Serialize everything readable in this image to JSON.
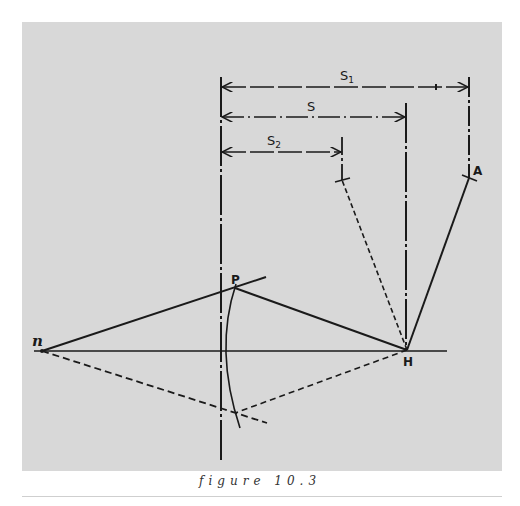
{
  "figure": {
    "caption": "figure 10.3",
    "background": "#d8d8d8",
    "ink": "#1a1a1a",
    "labels": {
      "S1": "S",
      "S1_sub": "1",
      "S": "S",
      "S2": "S",
      "S2_sub": "2",
      "A": "A",
      "P": "P",
      "H": "H",
      "n": "n"
    },
    "points": {
      "n": [
        42,
        351
      ],
      "P": [
        235,
        288
      ],
      "H": [
        407,
        350
      ],
      "A_tick": [
        469,
        178
      ],
      "S2_tick": [
        342,
        180
      ],
      "lower_intersection": [
        235,
        413
      ]
    }
  }
}
